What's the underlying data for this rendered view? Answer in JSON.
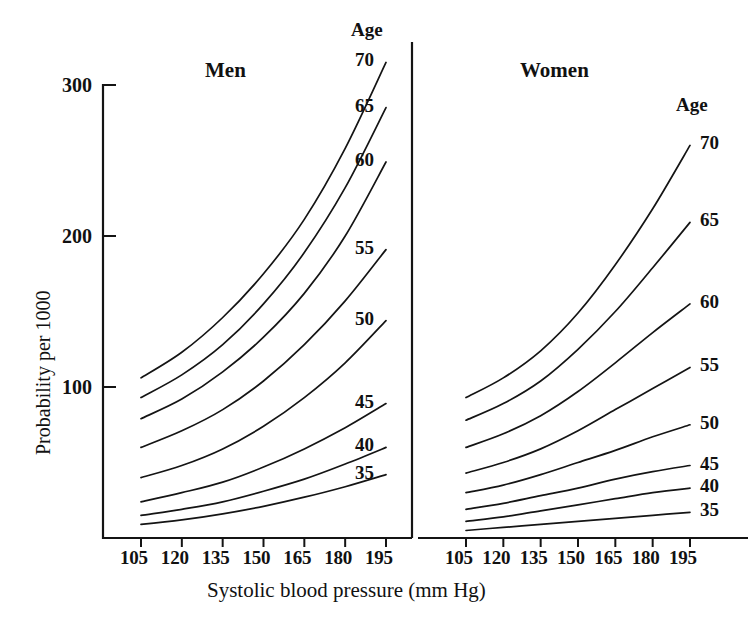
{
  "figure": {
    "y_axis_title": "Probability per 1000",
    "x_axis_title": "Systolic blood pressure (mm Hg)",
    "y_ticks": [
      "300",
      "200",
      "100"
    ],
    "x_ticks": [
      "105",
      "120",
      "135",
      "150",
      "165",
      "180",
      "195"
    ],
    "panels": [
      {
        "title": "Men",
        "age_header": "Age"
      },
      {
        "title": "Women",
        "age_header": "Age"
      }
    ],
    "line_color": "#141414"
  },
  "chart_data": {
    "type": "line",
    "title": "",
    "subtitle": "",
    "xlabel": "Systolic blood pressure (mm Hg)",
    "ylabel": "Probability per 1000",
    "x": [
      105,
      120,
      135,
      150,
      165,
      180,
      195
    ],
    "xlim": [
      105,
      195
    ],
    "ylim": [
      0,
      320
    ],
    "yticks": [
      100,
      200,
      300
    ],
    "xticks": [
      105,
      120,
      135,
      150,
      165,
      180,
      195
    ],
    "grid": false,
    "legend": "inline-right-end-labels",
    "panels": [
      {
        "name": "Men",
        "series": [
          {
            "name": "70",
            "label": "70",
            "values": [
              106,
              123,
              146,
              175,
              211,
              258,
              315
            ]
          },
          {
            "name": "65",
            "label": "65",
            "values": [
              93,
              108,
              128,
              155,
              189,
              232,
              285
            ]
          },
          {
            "name": "60",
            "label": "60",
            "values": [
              79,
              92,
              110,
              133,
              162,
              200,
              249
            ]
          },
          {
            "name": "55",
            "label": "55",
            "values": [
              60,
              71,
              85,
              104,
              128,
              157,
              191
            ]
          },
          {
            "name": "50",
            "label": "50",
            "values": [
              40,
              48,
              59,
              74,
              93,
              116,
              144
            ]
          },
          {
            "name": "45",
            "label": "45",
            "values": [
              24,
              30,
              37,
              47,
              59,
              73,
              89
            ]
          },
          {
            "name": "40",
            "label": "40",
            "values": [
              15,
              19,
              24,
              31,
              39,
              49,
              60
            ]
          },
          {
            "name": "35",
            "label": "35",
            "values": [
              9,
              12,
              16,
              21,
              27,
              34,
              42
            ]
          }
        ]
      },
      {
        "name": "Women",
        "series": [
          {
            "name": "70",
            "label": "70",
            "values": [
              93,
              106,
              124,
              149,
              181,
              218,
              260
            ]
          },
          {
            "name": "65",
            "label": "65",
            "values": [
              78,
              89,
              104,
              125,
              150,
              179,
              209
            ]
          },
          {
            "name": "60",
            "label": "60",
            "values": [
              60,
              69,
              81,
              97,
              116,
              136,
              155
            ]
          },
          {
            "name": "55",
            "label": "55",
            "values": [
              43,
              50,
              59,
              71,
              85,
              99,
              113
            ]
          },
          {
            "name": "50",
            "label": "50",
            "values": [
              30,
              35,
              42,
              50,
              58,
              67,
              75
            ]
          },
          {
            "name": "45",
            "label": "45",
            "values": [
              19,
              23,
              28,
              33,
              39,
              44,
              48
            ]
          },
          {
            "name": "40",
            "label": "40",
            "values": [
              11,
              14,
              18,
              22,
              26,
              30,
              33
            ]
          },
          {
            "name": "35",
            "label": "35",
            "values": [
              5,
              7,
              9,
              11,
              13,
              15,
              17
            ]
          }
        ]
      }
    ]
  }
}
